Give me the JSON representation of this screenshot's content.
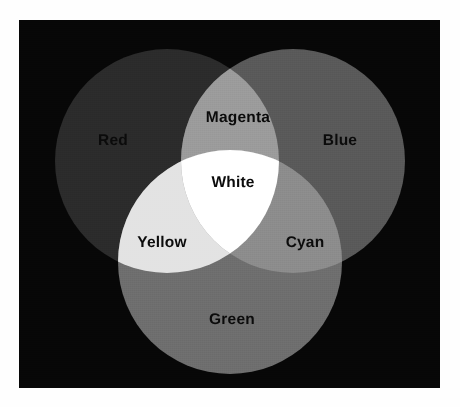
{
  "figure": {
    "background_color": "#070707",
    "page_color": "#fefefe",
    "rendering": "grayscale"
  },
  "chart_data": {
    "type": "venn",
    "set_count": 3,
    "grid": false,
    "legend": false,
    "sets": [
      {
        "name": "Red",
        "label": "Red",
        "fill": "#2b2b2b",
        "cx": 148,
        "cy": 141,
        "r": 112,
        "label_x": 94,
        "label_y": 121
      },
      {
        "name": "Blue",
        "label": "Blue",
        "fill": "#595959",
        "cx": 274,
        "cy": 141,
        "r": 112,
        "label_x": 321,
        "label_y": 121
      },
      {
        "name": "Green",
        "label": "Green",
        "fill": "#6e6e6e",
        "cx": 211,
        "cy": 242,
        "r": 112,
        "label_x": 213,
        "label_y": 300
      }
    ],
    "intersections": [
      {
        "name": "Magenta",
        "label": "Magenta",
        "members": [
          "Red",
          "Blue"
        ],
        "fill": "#9b9b9b",
        "label_x": 219,
        "label_y": 98
      },
      {
        "name": "Yellow",
        "label": "Yellow",
        "members": [
          "Red",
          "Green"
        ],
        "fill": "#e3e3e3",
        "label_x": 143,
        "label_y": 223
      },
      {
        "name": "Cyan",
        "label": "Cyan",
        "members": [
          "Blue",
          "Green"
        ],
        "fill": "#8c8c8c",
        "label_x": 286,
        "label_y": 223
      },
      {
        "name": "White",
        "label": "White",
        "members": [
          "Red",
          "Blue",
          "Green"
        ],
        "fill": "#ffffff",
        "label_x": 214,
        "label_y": 163
      }
    ]
  },
  "labels": {
    "red": "Red",
    "blue": "Blue",
    "green": "Green",
    "magenta": "Magenta",
    "yellow": "Yellow",
    "cyan": "Cyan",
    "white": "White"
  }
}
